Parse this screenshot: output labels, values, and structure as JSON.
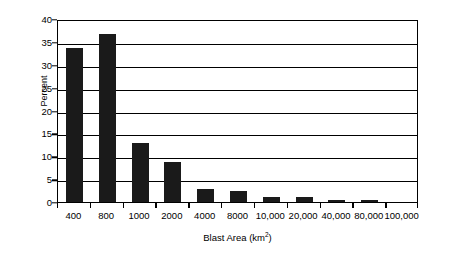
{
  "chart_data": {
    "type": "bar",
    "title": "",
    "subtitle": "",
    "xlabel": "Blast Area (km2)",
    "xlabel_base": "Blast Area (km",
    "xlabel_sup": "2",
    "xlabel_close": ")",
    "ylabel": "Percent",
    "ylim": [
      0,
      40
    ],
    "ytick_step": 5,
    "yticks": [
      0,
      5,
      10,
      15,
      20,
      25,
      30,
      35,
      40
    ],
    "ytick_labels": [
      "0",
      "5",
      "10",
      "15",
      "20",
      "25",
      "30",
      "35",
      "40"
    ],
    "grid": true,
    "grid_axis": "y",
    "legend": false,
    "legend_position": "none",
    "categories": [
      "400",
      "800",
      "1000",
      "2000",
      "4000",
      "8000",
      "10,000",
      "20,000",
      "40,000",
      "80,000",
      "100,000"
    ],
    "values": [
      33.6,
      36.8,
      12.9,
      8.7,
      2.8,
      2.4,
      1.2,
      1.0,
      0.5,
      0.45,
      0.0
    ],
    "bar_color": "#1a1a1a",
    "axis_color": "#000000",
    "background_color": "#ffffff"
  },
  "axes": {
    "y_title": "Percent",
    "x_title_full": "Blast Area (km2)"
  }
}
